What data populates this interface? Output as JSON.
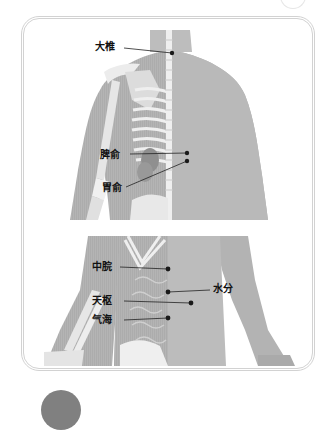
{
  "figure": {
    "upper_panel": {
      "view": "back",
      "points": [
        {
          "label": "大椎",
          "label_x": 95,
          "label_y": 41,
          "dot_x": 172,
          "dot_y": 53
        },
        {
          "label": "脾俞",
          "label_x": 100,
          "label_y": 149,
          "dot_x": 187,
          "dot_y": 153
        },
        {
          "label": "胃俞",
          "label_x": 102,
          "label_y": 182,
          "dot_x": 187,
          "dot_y": 161
        }
      ]
    },
    "lower_panel": {
      "view": "front",
      "points": [
        {
          "label": "中脘",
          "label_x": 92,
          "label_y": 261,
          "dot_x": 168,
          "dot_y": 269
        },
        {
          "label": "水分",
          "label_x": 213,
          "label_y": 283,
          "dot_x": 168,
          "dot_y": 292
        },
        {
          "label": "天枢",
          "label_x": 92,
          "label_y": 295,
          "dot_x": 191,
          "dot_y": 303
        },
        {
          "label": "气海",
          "label_x": 92,
          "label_y": 314,
          "dot_x": 168,
          "dot_y": 318
        }
      ]
    },
    "colors": {
      "skin_dark": "#a9a9a9",
      "skin_light": "#c8c8c8",
      "bone": "#efefef",
      "frame": "#d2d2d2",
      "disc": "#808080",
      "dot": "#1a1a1a"
    }
  }
}
